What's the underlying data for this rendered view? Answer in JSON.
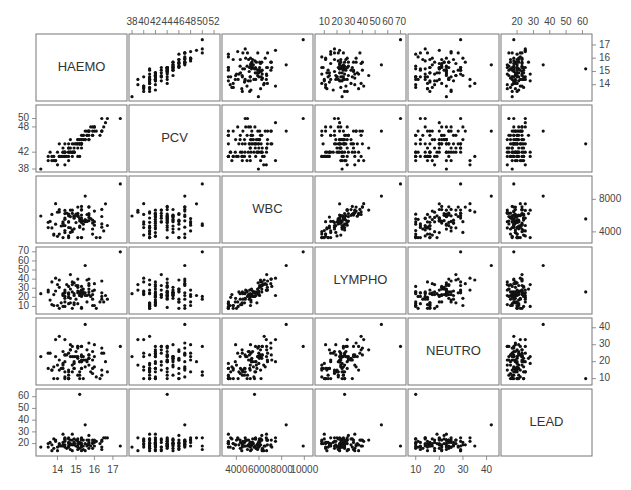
{
  "chart_data": {
    "type": "scatter",
    "subtype": "scatterplot-matrix",
    "title": "",
    "variables": [
      "HAEMO",
      "PCV",
      "WBC",
      "LYMPHO",
      "NEUTRO",
      "LEAD"
    ],
    "axes": {
      "HAEMO": {
        "range": [
          13.0,
          17.6
        ],
        "ticks": [
          14,
          15,
          16,
          17
        ],
        "tick_labels": [
          "14",
          "15",
          "16",
          "17"
        ],
        "tick_side": "bottom-col1,right-row1"
      },
      "PCV": {
        "range": [
          38,
          52.5
        ],
        "ticks": [
          38,
          40,
          42,
          44,
          46,
          48,
          50,
          52
        ],
        "tick_labels": [
          "38",
          "40",
          "42",
          "44",
          "46",
          "48",
          "50",
          "52"
        ],
        "left_ticks": [
          38,
          42,
          48,
          50
        ],
        "left_tick_labels": [
          "38",
          "42",
          "48",
          "50"
        ],
        "tick_side": "top-col2,left-row2"
      },
      "WBC": {
        "range": [
          3000,
          10500
        ],
        "ticks": [
          4000,
          6000,
          8000,
          10000
        ],
        "tick_labels": [
          "4000",
          "6000",
          "8000",
          "10000"
        ],
        "right_ticks": [
          4000,
          8000
        ],
        "right_tick_labels": [
          "4000",
          "8000"
        ],
        "tick_side": "bottom-col3,right-row3"
      },
      "LYMPHO": {
        "range": [
          5,
          72
        ],
        "ticks": [
          10,
          20,
          30,
          40,
          50,
          60,
          70
        ],
        "tick_labels": [
          "10",
          "20",
          "30",
          "40",
          "50",
          "60",
          "70"
        ],
        "tick_side": "top-col4,left-row4"
      },
      "NEUTRO": {
        "range": [
          8,
          44
        ],
        "ticks": [
          10,
          20,
          30,
          40
        ],
        "tick_labels": [
          "10",
          "20",
          "30",
          "40"
        ],
        "tick_side": "bottom-col5,right-row5"
      },
      "LEAD": {
        "range": [
          12,
          64
        ],
        "ticks": [
          20,
          30,
          40,
          50,
          60
        ],
        "tick_labels": [
          "20",
          "30",
          "40",
          "50",
          "60"
        ],
        "tick_side": "top-col6,left-row6"
      }
    },
    "n_observations": 103,
    "relationships": {
      "HAEMO~PCV": "strong positive",
      "WBC~LYMPHO": "strong positive",
      "WBC~NEUTRO": "moderate positive",
      "LEAD": "mostly 14-28, outliers near 36 and 62"
    },
    "grid": false,
    "legend": null
  }
}
